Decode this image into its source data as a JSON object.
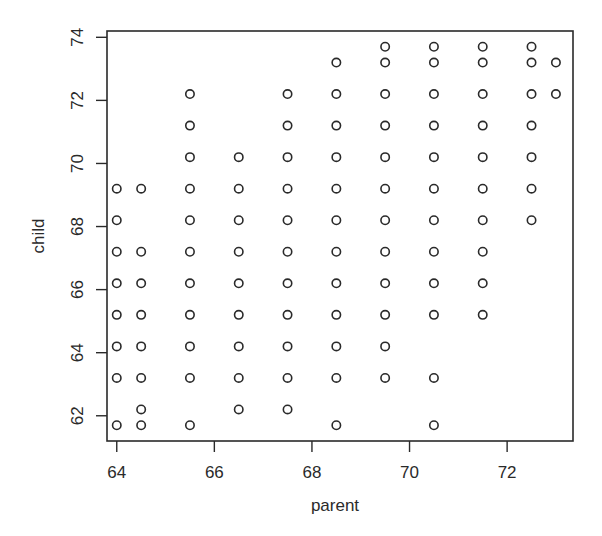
{
  "chart_data": {
    "type": "scatter",
    "title": "",
    "xlabel": "parent",
    "ylabel": "child",
    "xlim": [
      63.8,
      73.35
    ],
    "ylim": [
      61.2,
      74.2
    ],
    "xticks": [
      64,
      66,
      68,
      70,
      72
    ],
    "yticks": [
      62,
      64,
      66,
      68,
      70,
      72,
      74
    ],
    "xtick_labels": [
      "64",
      "66",
      "68",
      "70",
      "72"
    ],
    "ytick_labels": [
      "62",
      "64",
      "66",
      "68",
      "70",
      "72",
      "74"
    ],
    "grid": false,
    "marker": "open-circle",
    "marker_color": "#2a2a2a",
    "columns": [
      {
        "x": 64.0,
        "y": [
          69.2,
          68.2,
          67.2,
          66.2,
          65.2,
          64.2,
          63.2,
          61.7
        ]
      },
      {
        "x": 64.5,
        "y": [
          69.2,
          67.2,
          66.2,
          65.2,
          64.2,
          63.2,
          62.2,
          61.7
        ]
      },
      {
        "x": 65.5,
        "y": [
          72.2,
          71.2,
          70.2,
          69.2,
          68.2,
          67.2,
          66.2,
          65.2,
          64.2,
          63.2,
          61.7
        ]
      },
      {
        "x": 66.5,
        "y": [
          70.2,
          69.2,
          68.2,
          67.2,
          66.2,
          65.2,
          64.2,
          63.2,
          62.2
        ]
      },
      {
        "x": 67.5,
        "y": [
          72.2,
          71.2,
          70.2,
          69.2,
          68.2,
          67.2,
          66.2,
          65.2,
          64.2,
          63.2,
          62.2
        ]
      },
      {
        "x": 68.5,
        "y": [
          73.2,
          72.2,
          71.2,
          70.2,
          69.2,
          68.2,
          67.2,
          66.2,
          65.2,
          64.2,
          63.2,
          61.7
        ]
      },
      {
        "x": 69.5,
        "y": [
          73.7,
          73.2,
          72.2,
          71.2,
          70.2,
          69.2,
          68.2,
          67.2,
          66.2,
          65.2,
          64.2,
          63.2
        ]
      },
      {
        "x": 70.5,
        "y": [
          73.7,
          73.2,
          72.2,
          71.2,
          70.2,
          69.2,
          68.2,
          67.2,
          66.2,
          65.2,
          63.2,
          61.7
        ]
      },
      {
        "x": 71.5,
        "y": [
          73.7,
          73.2,
          72.2,
          71.2,
          70.2,
          69.2,
          68.2,
          67.2,
          66.2,
          65.2
        ]
      },
      {
        "x": 72.5,
        "y": [
          73.7,
          73.2,
          72.2,
          71.2,
          70.2,
          69.2,
          68.2
        ]
      },
      {
        "x": 73.0,
        "y": [
          73.2,
          72.2
        ]
      }
    ]
  }
}
